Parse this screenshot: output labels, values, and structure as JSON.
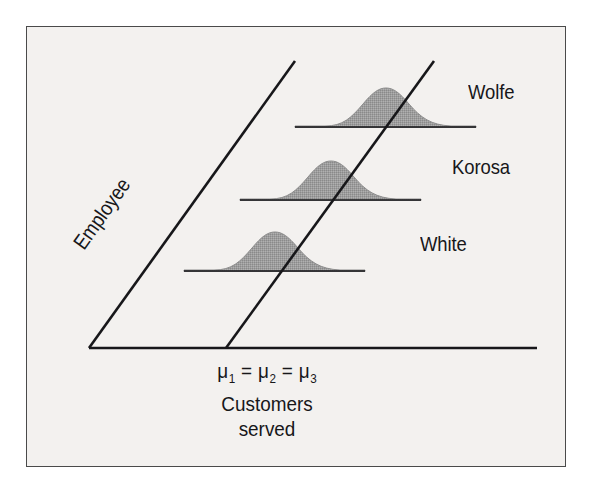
{
  "figure": {
    "kind": "statistical-illustration",
    "background_color": "#f3f1ef",
    "frame_color": "#4a4a4a",
    "ink_color": "#17171a",
    "curve_fill_color": "#9a9a9a",
    "curve_edge_color": "#8d8d8d"
  },
  "axes": {
    "depth_axis_label": "Employee",
    "horizontal_axis_caption_mu": "μ",
    "horizontal_axis_caption_line1_parts": [
      "μ",
      "1",
      " = ",
      "μ",
      "2",
      " = ",
      "μ",
      "3"
    ],
    "horizontal_axis_caption_line2": "Customers",
    "horizontal_axis_caption_line3": "served"
  },
  "series_labels": {
    "top": "Wolfe",
    "middle": "Korosa",
    "bottom": "White"
  },
  "chart_data": {
    "type": "area",
    "title": "",
    "subtitle": "",
    "xlabel": "Customers served",
    "ylabel": "Employee",
    "grid": false,
    "legend_position": "right-inline",
    "annotations": [
      "μ1 = μ2 = μ3",
      "Customers served",
      "Employee"
    ],
    "note": "Three identical normal distributions of customers served, one per employee, offset along an oblique Employee axis; a single oblique line marks the common mean of all three distributions.",
    "series": [
      {
        "name": "Wolfe",
        "distribution": "normal",
        "mean_marked": true,
        "baseline_y_px": 127,
        "baseline_x_start_px": 295,
        "baseline_x_end_px": 476,
        "peak_y_px": 88,
        "peak_x_px": 386,
        "relative_mean": 1.0,
        "relative_spread": 1.0,
        "relative_peak_height": 1.0
      },
      {
        "name": "Korosa",
        "distribution": "normal",
        "mean_marked": true,
        "baseline_y_px": 200,
        "baseline_x_start_px": 240,
        "baseline_x_end_px": 421,
        "peak_y_px": 161,
        "peak_x_px": 331,
        "relative_mean": 1.0,
        "relative_spread": 1.0,
        "relative_peak_height": 1.0
      },
      {
        "name": "White",
        "distribution": "normal",
        "mean_marked": true,
        "baseline_y_px": 271,
        "baseline_x_start_px": 184,
        "baseline_x_end_px": 365,
        "peak_y_px": 232,
        "peak_x_px": 275,
        "relative_mean": 1.0,
        "relative_spread": 1.0,
        "relative_peak_height": 1.0
      }
    ],
    "axis_lines": [
      {
        "name": "horizontal-baseline",
        "from": [
          89,
          348
        ],
        "to": [
          537,
          348
        ]
      },
      {
        "name": "employee-depth-axis",
        "from": [
          89,
          348
        ],
        "to": [
          295,
          61
        ]
      },
      {
        "name": "common-mean-line",
        "from": [
          226,
          348
        ],
        "to": [
          434,
          61
        ]
      }
    ]
  }
}
